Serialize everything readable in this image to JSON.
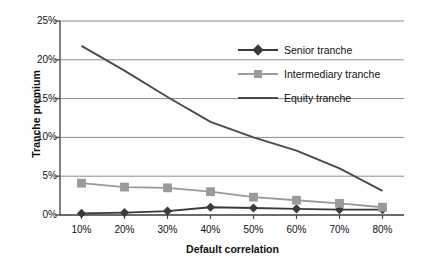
{
  "chart_data": {
    "type": "line",
    "title": "",
    "xlabel": "Default correlation",
    "ylabel": "Tranche premium",
    "categories": [
      "10%",
      "20%",
      "30%",
      "40%",
      "50%",
      "60%",
      "70%",
      "80%"
    ],
    "x": [
      10,
      20,
      30,
      40,
      50,
      60,
      70,
      80
    ],
    "xlim": [
      5,
      85
    ],
    "ylim": [
      0,
      25
    ],
    "yticks": [
      "0%",
      "5%",
      "10%",
      "15%",
      "20%",
      "25%"
    ],
    "ytick_values": [
      0,
      5,
      10,
      15,
      20,
      25
    ],
    "grid": "horizontal",
    "legend_position": "inside-top-right",
    "series": [
      {
        "name": "Senior tranche",
        "marker": "diamond",
        "color": "#3a3a3a",
        "values": [
          0.2,
          0.3,
          0.5,
          1.0,
          0.9,
          0.8,
          0.7,
          0.7
        ]
      },
      {
        "name": "Intermediary tranche",
        "marker": "square",
        "color": "#9a9a9a",
        "values": [
          4.1,
          3.6,
          3.5,
          3.0,
          2.3,
          1.9,
          1.5,
          1.0
        ]
      },
      {
        "name": "Equity tranche",
        "marker": "none",
        "color": "#4a4a4a",
        "values": [
          21.8,
          18.6,
          15.2,
          12.0,
          10.0,
          8.3,
          6.0,
          3.1
        ]
      }
    ]
  },
  "axis": {
    "ylabel": "Tranche premium",
    "xlabel": "Default correlation"
  },
  "legend": {
    "items": [
      {
        "label": "Senior tranche"
      },
      {
        "label": "Intermediary tranche"
      },
      {
        "label": "Equity tranche"
      }
    ]
  },
  "colors": {
    "senior": "#3a3a3a",
    "intermediary": "#9a9a9a",
    "equity": "#4a4a4a",
    "grid": "#8c8c8c",
    "axis": "#4d4d4d",
    "text": "#111111"
  }
}
